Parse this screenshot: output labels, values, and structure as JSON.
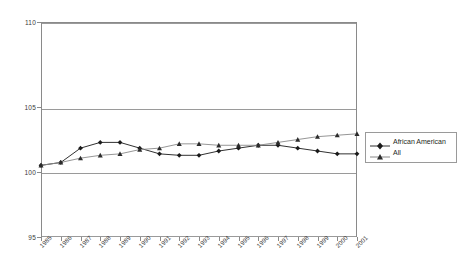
{
  "chart_data": {
    "type": "line",
    "title": "",
    "xlabel": "",
    "ylabel": "",
    "ylim": [
      95,
      110
    ],
    "yticks": [
      95,
      100,
      105,
      110
    ],
    "grid": true,
    "legend_position": "right",
    "categories": [
      "1985",
      "1986",
      "1987",
      "1988",
      "1989",
      "1990",
      "1991",
      "1992",
      "1993",
      "1994",
      "1995",
      "1996",
      "1997",
      "1998",
      "1999",
      "2000",
      "2001"
    ],
    "series": [
      {
        "name": "African American",
        "marker": "diamond",
        "color": "#1a1a1a",
        "values": [
          100.0,
          100.2,
          101.2,
          101.6,
          101.6,
          101.2,
          100.8,
          100.7,
          100.7,
          101.0,
          101.2,
          101.4,
          101.4,
          101.2,
          101.0,
          100.8,
          100.8
        ]
      },
      {
        "name": "All",
        "marker": "triangle",
        "color": "#4d4d4d",
        "values": [
          100.0,
          100.2,
          100.5,
          100.7,
          100.8,
          101.1,
          101.2,
          101.5,
          101.5,
          101.4,
          101.4,
          101.4,
          101.6,
          101.8,
          102.0,
          102.1,
          102.2
        ]
      }
    ]
  },
  "legend": {
    "items": [
      {
        "label": "African American"
      },
      {
        "label": "All"
      }
    ]
  },
  "axis": {
    "y_labels": [
      "110",
      "105",
      "100",
      "95"
    ]
  }
}
